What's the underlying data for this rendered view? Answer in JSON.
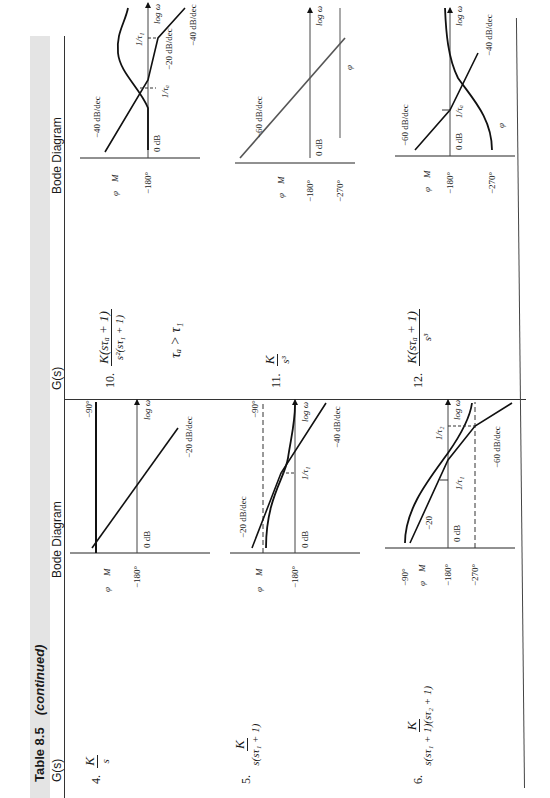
{
  "table": {
    "number": "Table 8.5",
    "suffix": "(continued)",
    "headers": {
      "left_gs": "G(s)",
      "left_bode": "Bode Diagram",
      "right_gs": "G(s)",
      "right_bode": "Bode Diagram"
    },
    "rows": [
      {
        "index": "4.",
        "numerator": "K",
        "denominator": "s",
        "bode": {
          "phase_symbol": "φ",
          "mag_symbol": "M",
          "phase_ref": "−180°",
          "phase_level": "−90°",
          "zero_db": "0 dB",
          "axis": "log ω",
          "slopes": [
            "−20 dB/dec"
          ]
        }
      },
      {
        "index": "5.",
        "numerator": "K",
        "denominator": "s(sτ₁ + 1)",
        "bode": {
          "phase_symbol": "φ",
          "mag_symbol": "M",
          "phase_ref": "−180°",
          "phase_level": "−90°",
          "zero_db": "0 dB",
          "axis": "log ω",
          "breakpoint": "1/τ₁",
          "slopes": [
            "−20 dB/dec",
            "−40 dB/dec"
          ]
        }
      },
      {
        "index": "6.",
        "numerator": "K",
        "denominator": "s(sτ₁ + 1)(sτ₂ + 1)",
        "bode": {
          "phase_symbol": "φ",
          "mag_symbol": "M",
          "phase_top": "−90°",
          "phase_ref": "−180°",
          "phase_bottom": "−270°",
          "zero_db": "0 dB",
          "axis": "log ω",
          "breakpoints": [
            "1/τ₁",
            "1/τ₂"
          ],
          "slopes": [
            "−20",
            "−60 dB/dec"
          ]
        }
      },
      {
        "index": "10.",
        "numerator": "K(sτₐ + 1)",
        "denominator": "s²(sτ₁ + 1)",
        "condition": "τₐ > τ₁",
        "bode": {
          "phase_symbol": "φ",
          "mag_symbol": "M",
          "phase_ref": "−180°",
          "zero_db": "0 dB",
          "axis": "log ω",
          "breakpoints": [
            "1/τₐ",
            "1/τ₁"
          ],
          "slopes": [
            "−40 dB/dec",
            "−20 dB/dec",
            "−40 dB/dec"
          ]
        }
      },
      {
        "index": "11.",
        "numerator": "K",
        "denominator": "s³",
        "bode": {
          "phase_symbol": "φ",
          "mag_symbol": "M",
          "phase_ref": "−180°",
          "phase_level": "−270°",
          "zero_db": "0 dB",
          "axis": "log ω",
          "slopes": [
            "−60 dB/dec"
          ]
        }
      },
      {
        "index": "12.",
        "numerator": "K(sτₐ + 1)",
        "denominator": "s³",
        "bode": {
          "phase_symbol": "φ",
          "mag_symbol": "M",
          "phase_ref": "−180°",
          "phase_bottom": "−270°",
          "zero_db": "0 dB",
          "axis": "log ω",
          "breakpoint": "1/τₐ",
          "slopes": [
            "−60 dB/dec",
            "−40 dB/dec"
          ]
        }
      }
    ]
  }
}
